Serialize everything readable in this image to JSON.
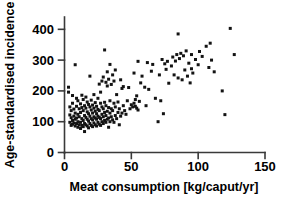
{
  "chart_data": {
    "type": "scatter",
    "title": "",
    "xlabel": "Meat consumption [kg/caput/yr]",
    "ylabel": "Age-standardised incidence",
    "xlim": [
      0,
      150
    ],
    "ylim": [
      0,
      440
    ],
    "xticks": [
      0,
      50,
      100,
      150
    ],
    "yticks": [
      0,
      100,
      200,
      300,
      400
    ],
    "xtick_labels": [
      "0",
      "50",
      "100",
      "150"
    ],
    "ytick_labels": [
      "0",
      "100",
      "200",
      "300",
      "400"
    ],
    "grid": false,
    "legend": "none",
    "marker": "square",
    "marker_color": "#131313",
    "series": [
      {
        "name": "Countries",
        "points": [
          [
            3,
            212
          ],
          [
            3,
            196
          ],
          [
            4,
            98
          ],
          [
            4,
            122
          ],
          [
            4,
            148
          ],
          [
            5,
            88
          ],
          [
            5,
            113
          ],
          [
            5,
            136
          ],
          [
            6,
            92
          ],
          [
            6,
            104
          ],
          [
            6,
            160
          ],
          [
            6,
            185
          ],
          [
            7,
            96
          ],
          [
            7,
            118
          ],
          [
            7,
            141
          ],
          [
            8,
            86
          ],
          [
            8,
            108
          ],
          [
            8,
            128
          ],
          [
            8,
            285
          ],
          [
            9,
            94
          ],
          [
            9,
            112
          ],
          [
            9,
            150
          ],
          [
            9,
            176
          ],
          [
            10,
            82
          ],
          [
            10,
            100
          ],
          [
            10,
            124
          ],
          [
            10,
            168
          ],
          [
            11,
            90
          ],
          [
            11,
            116
          ],
          [
            11,
            142
          ],
          [
            12,
            78
          ],
          [
            12,
            98
          ],
          [
            12,
            130
          ],
          [
            12,
            158
          ],
          [
            13,
            88
          ],
          [
            13,
            110
          ],
          [
            13,
            146
          ],
          [
            13,
            186
          ],
          [
            14,
            84
          ],
          [
            14,
            104
          ],
          [
            14,
            136
          ],
          [
            14,
            172
          ],
          [
            15,
            68
          ],
          [
            15,
            94
          ],
          [
            15,
            120
          ],
          [
            15,
            152
          ],
          [
            16,
            90
          ],
          [
            16,
            114
          ],
          [
            16,
            144
          ],
          [
            16,
            180
          ],
          [
            17,
            86
          ],
          [
            17,
            108
          ],
          [
            17,
            132
          ],
          [
            17,
            164
          ],
          [
            18,
            80
          ],
          [
            18,
            102
          ],
          [
            18,
            126
          ],
          [
            18,
            156
          ],
          [
            19,
            94
          ],
          [
            19,
            118
          ],
          [
            19,
            148
          ],
          [
            19,
            248
          ],
          [
            20,
            88
          ],
          [
            20,
            110
          ],
          [
            20,
            138
          ],
          [
            20,
            170
          ],
          [
            21,
            84
          ],
          [
            21,
            106
          ],
          [
            21,
            128
          ],
          [
            21,
            154
          ],
          [
            22,
            96
          ],
          [
            22,
            116
          ],
          [
            22,
            144
          ],
          [
            22,
            188
          ],
          [
            23,
            90
          ],
          [
            23,
            112
          ],
          [
            23,
            134
          ],
          [
            23,
            162
          ],
          [
            24,
            86
          ],
          [
            24,
            108
          ],
          [
            24,
            126
          ],
          [
            24,
            150
          ],
          [
            25,
            98
          ],
          [
            25,
            118
          ],
          [
            25,
            140
          ],
          [
            25,
            176
          ],
          [
            26,
            92
          ],
          [
            26,
            114
          ],
          [
            26,
            136
          ],
          [
            26,
            222
          ],
          [
            27,
            88
          ],
          [
            27,
            110
          ],
          [
            27,
            160
          ],
          [
            27,
            196
          ],
          [
            28,
            100
          ],
          [
            28,
            124
          ],
          [
            28,
            148
          ],
          [
            28,
            232
          ],
          [
            29,
            94
          ],
          [
            29,
            116
          ],
          [
            29,
            142
          ],
          [
            29,
            245
          ],
          [
            30,
            104
          ],
          [
            30,
            130
          ],
          [
            30,
            163
          ],
          [
            30,
            333
          ],
          [
            31,
            98
          ],
          [
            31,
            120
          ],
          [
            31,
            152
          ],
          [
            31,
            228
          ],
          [
            32,
            108
          ],
          [
            32,
            134
          ],
          [
            32,
            216
          ],
          [
            32,
            262
          ],
          [
            33,
            82
          ],
          [
            33,
            112
          ],
          [
            33,
            146
          ],
          [
            33,
            238
          ],
          [
            34,
            100
          ],
          [
            34,
            128
          ],
          [
            34,
            168
          ],
          [
            34,
            286
          ],
          [
            35,
            116
          ],
          [
            35,
            142
          ],
          [
            35,
            221
          ],
          [
            36,
            106
          ],
          [
            36,
            136
          ],
          [
            36,
            252
          ],
          [
            37,
            98
          ],
          [
            37,
            160
          ],
          [
            37,
            232
          ],
          [
            38,
            120
          ],
          [
            38,
            148
          ],
          [
            38,
            268
          ],
          [
            39,
            110
          ],
          [
            39,
            188
          ],
          [
            40,
            130
          ],
          [
            40,
            164
          ],
          [
            41,
            90
          ],
          [
            41,
            142
          ],
          [
            42,
            118
          ],
          [
            42,
            236
          ],
          [
            43,
            128
          ],
          [
            43,
            208
          ],
          [
            44,
            152
          ],
          [
            44,
            214
          ],
          [
            45,
            136
          ],
          [
            46,
            124
          ],
          [
            47,
            168
          ],
          [
            48,
            211
          ],
          [
            49,
            142
          ],
          [
            50,
            155
          ],
          [
            51,
            148
          ],
          [
            52,
            160
          ],
          [
            52,
            258
          ],
          [
            53,
            150
          ],
          [
            53,
            172
          ],
          [
            54,
            144
          ],
          [
            54,
            184
          ],
          [
            55,
            138
          ],
          [
            55,
            296
          ],
          [
            56,
            166
          ],
          [
            57,
            226
          ],
          [
            58,
            248
          ],
          [
            60,
            212
          ],
          [
            61,
            152
          ],
          [
            62,
            292
          ],
          [
            63,
            205
          ],
          [
            65,
            264
          ],
          [
            66,
            286
          ],
          [
            68,
            176
          ],
          [
            70,
            100
          ],
          [
            71,
            252
          ],
          [
            72,
            168
          ],
          [
            73,
            302
          ],
          [
            74,
            126
          ],
          [
            75,
            288
          ],
          [
            76,
            270
          ],
          [
            77,
            296
          ],
          [
            78,
            225
          ],
          [
            80,
            281
          ],
          [
            81,
            310
          ],
          [
            82,
            252
          ],
          [
            83,
            297
          ],
          [
            84,
            318
          ],
          [
            85,
            385
          ],
          [
            85,
            242
          ],
          [
            86,
            305
          ],
          [
            87,
            322
          ],
          [
            88,
            236
          ],
          [
            89,
            314
          ],
          [
            90,
            268
          ],
          [
            91,
            330
          ],
          [
            92,
            248
          ],
          [
            93,
            290
          ],
          [
            94,
            226
          ],
          [
            95,
            272
          ],
          [
            95,
            318
          ],
          [
            96,
            258
          ],
          [
            98,
            302
          ],
          [
            100,
            285
          ],
          [
            101,
            328
          ],
          [
            103,
            312
          ],
          [
            106,
            345
          ],
          [
            108,
            276
          ],
          [
            109,
            355
          ],
          [
            110,
            300
          ],
          [
            112,
            262
          ],
          [
            118,
            200
          ],
          [
            120,
            123
          ],
          [
            124,
            403
          ],
          [
            127,
            318
          ]
        ]
      }
    ]
  },
  "axes": {
    "x_axis_name": "x-axis",
    "y_axis_name": "y-axis"
  }
}
